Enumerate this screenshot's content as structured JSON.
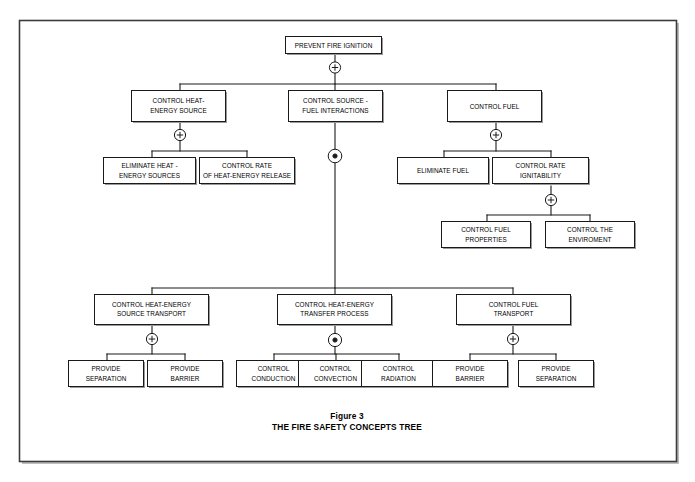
{
  "figure": {
    "caption_line1": "Figure 3",
    "caption_line2": "THE FIRE SAFETY CONCEPTS TREE"
  },
  "nodes": {
    "root": {
      "line1": "PREVENT FIRE IGNITION",
      "line2": ""
    },
    "heat_energy_source": {
      "line1": "CONTROL HEAT-",
      "line2": "ENERGY SOURCE"
    },
    "source_fuel_interactions": {
      "line1": "CONTROL SOURCE -",
      "line2": "FUEL INTERACTIONS"
    },
    "control_fuel": {
      "line1": "CONTROL FUEL",
      "line2": ""
    },
    "eliminate_heat_energy_sources": {
      "line1": "ELIMINATE HEAT -",
      "line2": "ENERGY SOURCES"
    },
    "control_rate_heat_energy_release": {
      "line1": "CONTROL RATE",
      "line2": "OF HEAT-ENERGY RELEASE"
    },
    "eliminate_fuel": {
      "line1": "ELIMINATE FUEL",
      "line2": ""
    },
    "control_rate_ignitability": {
      "line1": "CONTROL RATE",
      "line2": "IGNITABILITY"
    },
    "control_fuel_properties": {
      "line1": "CONTROL FUEL",
      "line2": "PROPERTIES"
    },
    "control_the_enviroment": {
      "line1": "CONTROL THE",
      "line2": "ENVIROMENT"
    },
    "heat_energy_source_transport": {
      "line1": "CONTROL HEAT-ENERGY",
      "line2": "SOURCE TRANSPORT"
    },
    "heat_energy_transfer_process": {
      "line1": "CONTROL HEAT-ENERGY",
      "line2": "TRANSFER PROCESS"
    },
    "control_fuel_transport": {
      "line1": "CONTROL FUEL",
      "line2": "TRANSPORT"
    },
    "provide_separation_left": {
      "line1": "PROVIDE",
      "line2": "SEPARATION"
    },
    "provide_barrier_left": {
      "line1": "PROVIDE",
      "line2": "BARRIER"
    },
    "control_conduction": {
      "line1": "CONTROL",
      "line2": "CONDUCTION"
    },
    "control_convection": {
      "line1": "CONTROL",
      "line2": "CONVECTION"
    },
    "control_radiation": {
      "line1": "CONTROL",
      "line2": "RADIATION"
    },
    "provide_barrier_right": {
      "line1": "PROVIDE",
      "line2": "BARRIER"
    },
    "provide_separation_right": {
      "line1": "PROVIDE",
      "line2": "SEPARATION"
    }
  },
  "gates": {
    "root_gate": "or",
    "heat_energy_source_gate": "or",
    "source_fuel_interactions_gate": "and",
    "control_fuel_gate": "or",
    "control_rate_ignitability_gate": "or",
    "heat_energy_source_transport_gate": "or",
    "heat_energy_transfer_process_gate": "and",
    "control_fuel_transport_gate": "or",
    "or_symbol": "+",
    "and_symbol": "•"
  },
  "colors": {
    "line": "#1a1a1a",
    "frame": "#3c3c3c",
    "shadow": "#9a9a9a",
    "background": "#ffffff",
    "text": "#000000"
  }
}
